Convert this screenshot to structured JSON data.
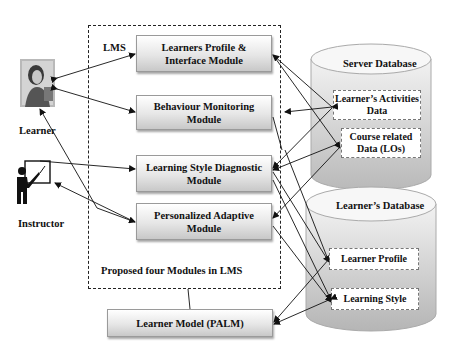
{
  "diagram": {
    "lms_label": "LMS",
    "lms_caption": "Proposed four Modules in LMS",
    "actors": {
      "learner": "Learner",
      "instructor": "Instructor"
    },
    "modules": [
      {
        "line1": "Learners Profile &",
        "line2": "Interface Module"
      },
      {
        "line1": "Behaviour Monitoring",
        "line2": "Module"
      },
      {
        "line1": "Learning Style Diagnostic",
        "line2": "Module"
      },
      {
        "line1": "Personalized Adaptive",
        "line2": "Module"
      }
    ],
    "learner_model": "Learner Model (PALM)",
    "server_db": {
      "title": "Server Database",
      "items": [
        {
          "line1": "Learner’s Activities",
          "line2": "Data"
        },
        {
          "line1": "Course related",
          "line2": "Data (LOs)"
        }
      ]
    },
    "learner_db": {
      "title": "Learner’s Database",
      "items": [
        {
          "line1": "Learner Profile"
        },
        {
          "line1": "Learning Style"
        }
      ]
    },
    "colors": {
      "line": "#222222",
      "cylinder_top": "#f4f4f4",
      "cylinder_body": "#cfcfcf",
      "module_fill": "#e6e6e6"
    }
  }
}
